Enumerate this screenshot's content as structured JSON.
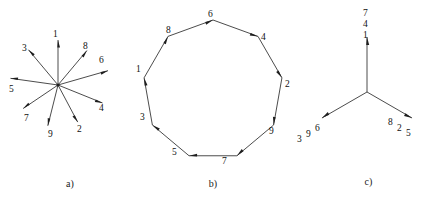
{
  "figure": {
    "background_color": "#ffffff",
    "ink_color": "#1e1e1e"
  },
  "panels": [
    {
      "id": "a",
      "caption": "a)",
      "type": "star-of-vectors",
      "description": "Nine arrows radiating from a common origin",
      "center": {
        "x": 58,
        "y": 85
      },
      "spokes": [
        {
          "label": "1",
          "angle_deg": 90,
          "length": 45,
          "label_x": 53,
          "label_y": 30
        },
        {
          "label": "8",
          "angle_deg": 50,
          "length": 45,
          "label_x": 83,
          "label_y": 42
        },
        {
          "label": "6",
          "angle_deg": 16,
          "length": 52,
          "label_x": 99,
          "label_y": 56
        },
        {
          "label": "4",
          "angle_deg": -22,
          "length": 48,
          "label_x": 99,
          "label_y": 104
        },
        {
          "label": "2",
          "angle_deg": -62,
          "length": 42,
          "label_x": 77,
          "label_y": 125
        },
        {
          "label": "9",
          "angle_deg": -104,
          "length": 42,
          "label_x": 48,
          "label_y": 130
        },
        {
          "label": "7",
          "angle_deg": -146,
          "length": 42,
          "label_x": 24,
          "label_y": 114
        },
        {
          "label": "5",
          "angle_deg": 172,
          "length": 48,
          "label_x": 9,
          "label_y": 85
        },
        {
          "label": "3",
          "angle_deg": 130,
          "length": 46,
          "label_x": 22,
          "label_y": 44
        }
      ]
    },
    {
      "id": "b",
      "caption": "b)",
      "type": "directed-nonagon",
      "description": "Regular nine-sided polygon with arrowheads at each vertex, traversed clockwise",
      "center": {
        "x": 95,
        "y": 90
      },
      "radius": 70,
      "vertices": [
        {
          "label": "6",
          "angle_deg": 90,
          "label_x": 90,
          "label_y": 10
        },
        {
          "label": "4",
          "angle_deg": 50,
          "label_x": 143,
          "label_y": 33
        },
        {
          "label": "2",
          "angle_deg": 10,
          "label_x": 167,
          "label_y": 80
        },
        {
          "label": "9",
          "angle_deg": -30,
          "label_x": 151,
          "label_y": 127
        },
        {
          "label": "7",
          "angle_deg": -70,
          "label_x": 104,
          "label_y": 157
        },
        {
          "label": "5",
          "angle_deg": -110,
          "label_x": 54,
          "label_y": 148
        },
        {
          "label": "3",
          "angle_deg": -150,
          "label_x": 22,
          "label_y": 113
        },
        {
          "label": "1",
          "angle_deg": 170,
          "label_x": 18,
          "label_y": 65
        },
        {
          "label": "8",
          "angle_deg": 130,
          "label_x": 48,
          "label_y": 26
        }
      ]
    },
    {
      "id": "c",
      "caption": "c)",
      "type": "three-arrow-star",
      "description": "Three arrows at 120 degrees from a common origin, each tagged with three numbers",
      "center": {
        "x": 75,
        "y": 92
      },
      "arms": [
        {
          "direction": "up",
          "angle_deg": 90,
          "length": 55,
          "labels": [
            "7",
            "4",
            "1"
          ],
          "layout": "vertical-stack",
          "label_x": 71,
          "label_y": 8
        },
        {
          "direction": "lower-left",
          "angle_deg": -150,
          "length": 52,
          "labels": [
            "3",
            "9",
            "6"
          ],
          "layout": "diagonal-up",
          "label_x": 5,
          "label_y": 124
        },
        {
          "direction": "lower-right",
          "angle_deg": -30,
          "length": 52,
          "labels": [
            "8",
            "2",
            "5"
          ],
          "layout": "diagonal-down",
          "label_x": 96,
          "label_y": 118
        }
      ]
    }
  ]
}
